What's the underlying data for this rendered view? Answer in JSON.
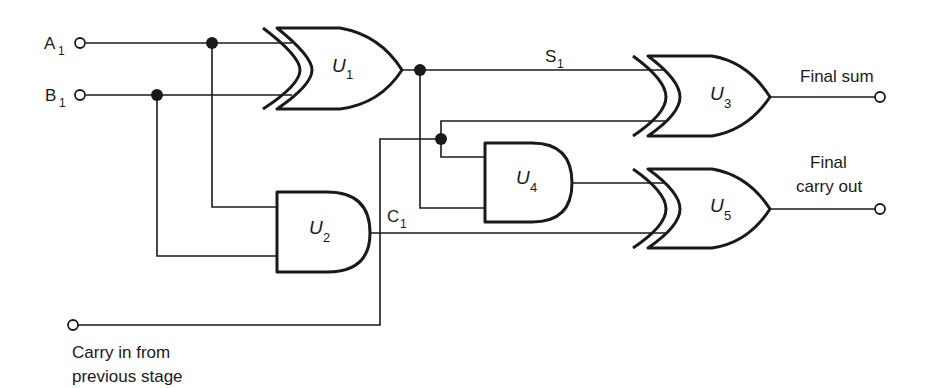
{
  "diagram": {
    "inputs": [
      {
        "name": "A",
        "sub": "1"
      },
      {
        "name": "B",
        "sub": "1"
      }
    ],
    "carry_in": {
      "line1": "Carry in from",
      "line2": "previous stage"
    },
    "signals": {
      "sum": {
        "name": "S",
        "sub": "1"
      },
      "carry": {
        "name": "C",
        "sub": "1"
      }
    },
    "gates": [
      {
        "id": "U1",
        "label": "U",
        "sub": "1",
        "type": "XOR"
      },
      {
        "id": "U2",
        "label": "U",
        "sub": "2",
        "type": "AND"
      },
      {
        "id": "U3",
        "label": "U",
        "sub": "3",
        "type": "XOR"
      },
      {
        "id": "U4",
        "label": "U",
        "sub": "4",
        "type": "AND"
      },
      {
        "id": "U5",
        "label": "U",
        "sub": "5",
        "type": "XOR"
      }
    ],
    "outputs": {
      "sum": "Final sum",
      "carry_line1": "Final",
      "carry_line2": "carry out"
    },
    "colors": {
      "ink": "#1a1a1a",
      "background": "#ffffff"
    }
  }
}
